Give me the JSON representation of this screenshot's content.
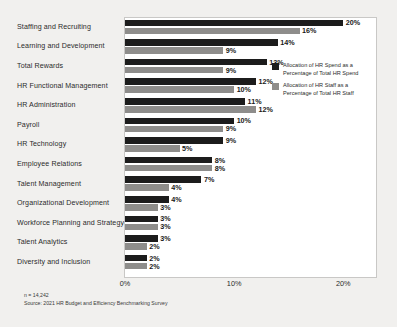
{
  "chart_data": {
    "type": "bar",
    "orientation": "horizontal",
    "title": "",
    "xlabel": "",
    "ylabel": "",
    "xlim": [
      0,
      23
    ],
    "grid": false,
    "legend_position": "right",
    "categories": [
      "Staffing and Recruiting",
      "Learning and Development",
      "Total Rewards",
      "HR Functional Management",
      "HR Administration",
      "Payroll",
      "HR Technology",
      "Employee Relations",
      "Talent Management",
      "Organizational Development",
      "Workforce Planning and Strategy",
      "Talent Analytics",
      "Diversity and Inclusion"
    ],
    "tick_labels": [
      "0%",
      "10%",
      "20%"
    ],
    "tick_values": [
      0,
      10,
      20
    ],
    "series": [
      {
        "name": "Allocation of HR Spend as a Percentage of Total HR Spend",
        "color": "#1c1c1c",
        "values": [
          20,
          14,
          13,
          12,
          11,
          10,
          9,
          8,
          7,
          4,
          3,
          3,
          2
        ],
        "labels": [
          "20%",
          "14%",
          "13%",
          "12%",
          "11%",
          "10%",
          "9%",
          "8%",
          "7%",
          "4%",
          "3%",
          "3%",
          "2%"
        ]
      },
      {
        "name": "Allocation of HR Staff as a Percentage of Total HR Staff",
        "color": "#8e8d8b",
        "values": [
          16,
          9,
          9,
          10,
          12,
          9,
          5,
          8,
          4,
          3,
          3,
          2,
          2
        ],
        "labels": [
          "16%",
          "9%",
          "9%",
          "10%",
          "12%",
          "9%",
          "5%",
          "8%",
          "4%",
          "3%",
          "3%",
          "2%",
          "2%"
        ]
      }
    ]
  },
  "legend": {
    "items": [
      {
        "swatch": "dark",
        "line1": "Allocation of HR Spend as a",
        "line2": "Percentage of Total HR Spend"
      },
      {
        "swatch": "gray",
        "line1": "Allocation of HR Staff as a",
        "line2": "Percentage of Total HR Staff"
      }
    ]
  },
  "footnote": {
    "sample": "n = 14,242",
    "source": "Source: 2021 HR Budget and Efficiency Benchmarking Survey"
  }
}
